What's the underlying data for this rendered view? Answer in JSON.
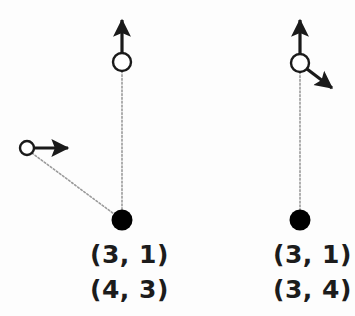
{
  "figure": {
    "background_color": "#fdfdfd",
    "stroke_color": "#1a1a1a",
    "dotted_color": "#9a9a9a",
    "open_node_fill": "#ffffff",
    "filled_node_fill": "#000000"
  },
  "left_group": {
    "name": "left-configuration",
    "open_node_top": {
      "cx": 122,
      "cy": 62,
      "r": 9
    },
    "open_node_side": {
      "cx": 27,
      "cy": 148,
      "r": 7
    },
    "filled_node": {
      "cx": 122,
      "cy": 220,
      "r": 10
    },
    "arrows": [
      {
        "name": "up-arrow-top-node",
        "x1": 122,
        "y1": 53,
        "x2": 122,
        "y2": 16
      },
      {
        "name": "right-arrow-side-node",
        "x1": 34,
        "y1": 148,
        "x2": 72,
        "y2": 148
      }
    ],
    "dotted_edges": [
      {
        "name": "vertical-edge",
        "x1": 122,
        "y1": 71,
        "x2": 122,
        "y2": 210
      },
      {
        "name": "diagonal-edge",
        "x1": 32,
        "y1": 153,
        "x2": 114,
        "y2": 214
      }
    ],
    "labels": {
      "line1": "(3, 1)",
      "line2": "(4, 3)"
    }
  },
  "right_group": {
    "name": "right-configuration",
    "open_node_top": {
      "cx": 300,
      "cy": 63,
      "r": 9
    },
    "filled_node": {
      "cx": 300,
      "cy": 220,
      "r": 10
    },
    "arrows": [
      {
        "name": "up-arrow-top-node",
        "x1": 300,
        "y1": 54,
        "x2": 300,
        "y2": 16
      },
      {
        "name": "diagonal-arrow-top-node",
        "x1": 307,
        "y1": 70,
        "x2": 336,
        "y2": 92
      }
    ],
    "dotted_edges": [
      {
        "name": "vertical-edge",
        "x1": 300,
        "y1": 72,
        "x2": 300,
        "y2": 210
      }
    ],
    "labels": {
      "line1": "(3, 1)",
      "line2": "(3, 4)"
    }
  }
}
